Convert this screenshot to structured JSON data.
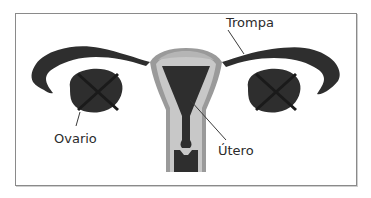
{
  "figure": {
    "labels": {
      "tube": "Trompa",
      "ovary": "Ovario",
      "uterus": "Útero"
    },
    "colors": {
      "organ_dark": "#2e2e2e",
      "uterine_wall": "#9a9a9a",
      "uterine_lining": "#c8c8c8",
      "ovary_cross": "#1a1a1a",
      "frame_border": "#8a8a8a",
      "label_text": "#2b2b2b"
    }
  }
}
